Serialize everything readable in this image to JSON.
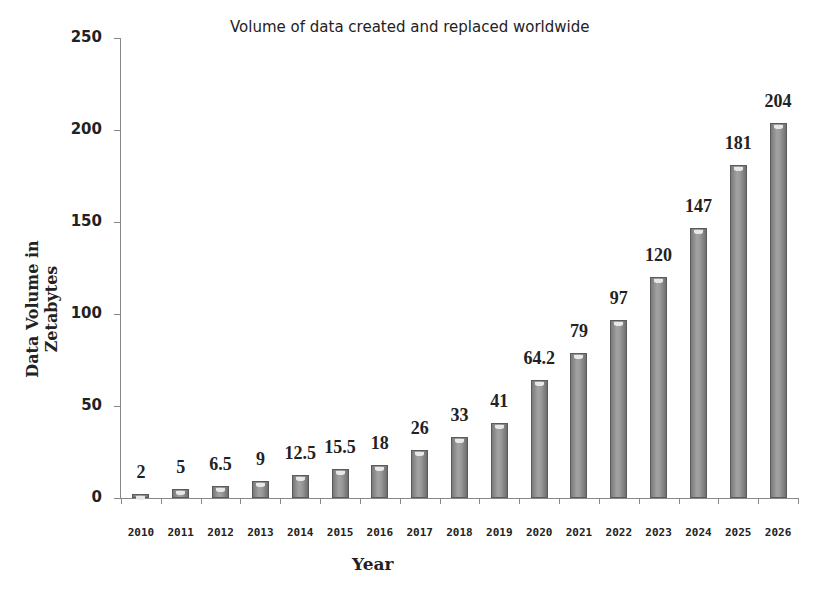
{
  "chart_data": {
    "type": "bar",
    "title": "Volume of data created and replaced worldwide",
    "xlabel": "Year",
    "ylabel": "Data Volume in Zetabytes",
    "categories": [
      "2010",
      "2011",
      "2012",
      "2013",
      "2014",
      "2015",
      "2016",
      "2017",
      "2018",
      "2019",
      "2020",
      "2021",
      "2022",
      "2023",
      "2024",
      "2025",
      "2026"
    ],
    "values": [
      2,
      5,
      6.5,
      9,
      12.5,
      15.5,
      18,
      26,
      33,
      41,
      64.2,
      79,
      97,
      120,
      147,
      181,
      204
    ],
    "value_labels": [
      "2",
      "5",
      "6.5",
      "9",
      "12.5",
      "15.5",
      "18",
      "26",
      "33",
      "41",
      "64.2",
      "79",
      "97",
      "120",
      "147",
      "181",
      "204"
    ],
    "ylim": [
      0,
      250
    ],
    "yticks": [
      0,
      50,
      100,
      150,
      200,
      250
    ],
    "ytick_labels": [
      "0",
      "50",
      "100",
      "150",
      "200",
      "250"
    ],
    "grid": false,
    "legend": null,
    "bar_color": "#8c8c8c"
  }
}
